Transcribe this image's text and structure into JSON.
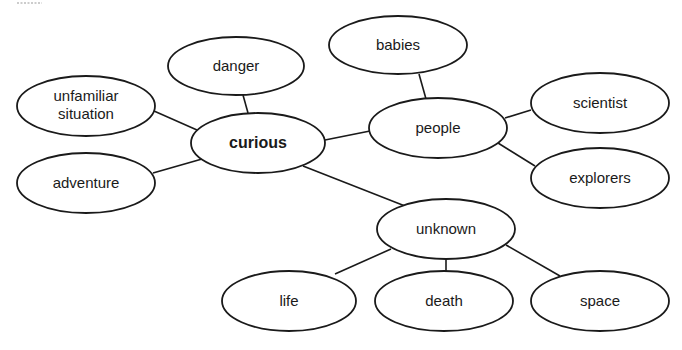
{
  "diagram": {
    "type": "concept-web",
    "central_node": "curious",
    "nodes": [
      {
        "id": "curious",
        "label": "curious",
        "cx": 258,
        "cy": 143,
        "rx": 67,
        "ry": 30,
        "bold": true
      },
      {
        "id": "danger",
        "label": "danger",
        "cx": 236,
        "cy": 66,
        "rx": 68,
        "ry": 29
      },
      {
        "id": "unfamiliar",
        "label_lines": [
          "unfamiliar",
          "situation"
        ],
        "cx": 86,
        "cy": 106,
        "rx": 69,
        "ry": 30
      },
      {
        "id": "adventure",
        "label": "adventure",
        "cx": 86,
        "cy": 183,
        "rx": 69,
        "ry": 30
      },
      {
        "id": "people",
        "label": "people",
        "cx": 438,
        "cy": 128,
        "rx": 69,
        "ry": 30
      },
      {
        "id": "babies",
        "label": "babies",
        "cx": 398,
        "cy": 45,
        "rx": 69,
        "ry": 29
      },
      {
        "id": "scientist",
        "label": "scientist",
        "cx": 600,
        "cy": 103,
        "rx": 69,
        "ry": 30
      },
      {
        "id": "explorers",
        "label": "explorers",
        "cx": 600,
        "cy": 178,
        "rx": 69,
        "ry": 30
      },
      {
        "id": "unknown",
        "label": "unknown",
        "cx": 446,
        "cy": 229,
        "rx": 69,
        "ry": 30
      },
      {
        "id": "life",
        "label": "life",
        "cx": 289,
        "cy": 301,
        "rx": 67,
        "ry": 30
      },
      {
        "id": "death",
        "label": "death",
        "cx": 444,
        "cy": 301,
        "rx": 69,
        "ry": 30
      },
      {
        "id": "space",
        "label": "space",
        "cx": 600,
        "cy": 301,
        "rx": 69,
        "ry": 30
      }
    ],
    "edges": [
      {
        "from": "curious",
        "to": "danger",
        "x1": 248,
        "y1": 113,
        "x2": 243,
        "y2": 95
      },
      {
        "from": "curious",
        "to": "unfamiliar",
        "x1": 197,
        "y1": 130,
        "x2": 154,
        "y2": 111
      },
      {
        "from": "curious",
        "to": "adventure",
        "x1": 202,
        "y1": 159,
        "x2": 153,
        "y2": 173
      },
      {
        "from": "curious",
        "to": "people",
        "x1": 325,
        "y1": 140,
        "x2": 370,
        "y2": 131
      },
      {
        "from": "curious",
        "to": "unknown",
        "x1": 303,
        "y1": 166,
        "x2": 405,
        "y2": 206
      },
      {
        "from": "people",
        "to": "babies",
        "x1": 426,
        "y1": 99,
        "x2": 419,
        "y2": 74
      },
      {
        "from": "people",
        "to": "scientist",
        "x1": 505,
        "y1": 118,
        "x2": 531,
        "y2": 110
      },
      {
        "from": "people",
        "to": "explorers",
        "x1": 498,
        "y1": 143,
        "x2": 535,
        "y2": 166
      },
      {
        "from": "unknown",
        "to": "life",
        "x1": 391,
        "y1": 249,
        "x2": 335,
        "y2": 274
      },
      {
        "from": "unknown",
        "to": "death",
        "x1": 446,
        "y1": 259,
        "x2": 446,
        "y2": 271
      },
      {
        "from": "unknown",
        "to": "space",
        "x1": 506,
        "y1": 245,
        "x2": 560,
        "y2": 276
      }
    ],
    "colors": {
      "stroke": "#1a1a1a",
      "fill": "#ffffff",
      "background": "#ffffff"
    }
  }
}
